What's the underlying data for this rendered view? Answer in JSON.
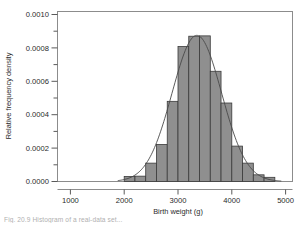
{
  "figure": {
    "caption": "Fig. 20.9 Histogram of a real-data set..."
  },
  "chart_data": {
    "type": "bar",
    "title": "",
    "subtitle": "",
    "xlabel": "Birth weight (g)",
    "ylabel": "Relative frequency density",
    "xlim": [
      700,
      5150
    ],
    "ylim": [
      0.0,
      0.00105
    ],
    "xticks": [
      1000,
      2000,
      3000,
      4000,
      5000
    ],
    "xtick_labels": [
      "1000",
      "2000",
      "3000",
      "4000",
      "5000"
    ],
    "yticks": [
      0.0,
      0.0002,
      0.0004,
      0.0006,
      0.0008,
      0.001
    ],
    "ytick_labels": [
      "0.0000",
      "0.0002",
      "0.0004",
      "0.0006",
      "0.0008",
      "0.0010"
    ],
    "yminorticks": [
      0.0001,
      0.0003,
      0.0005,
      0.0007,
      0.0009
    ],
    "grid": false,
    "legend": null,
    "bin_width": 200,
    "bar_color": "#8f8f8f",
    "bar_edge_color": "#3a3a3a",
    "curve_color": "#4a4a4a",
    "frame_color": "#8c8c8c",
    "bin_edges": [
      2000,
      2200,
      2400,
      2600,
      2800,
      3000,
      3200,
      3400,
      3600,
      3800,
      4000,
      4200,
      4400,
      4600,
      4800
    ],
    "categories": [
      "2000-2200",
      "2200-2400",
      "2400-2600",
      "2600-2800",
      "2800-3000",
      "3000-3200",
      "3200-3400",
      "3400-3600",
      "3600-3800",
      "3800-4000",
      "4000-4200",
      "4200-4400",
      "4400-4600",
      "4600-4800"
    ],
    "values": [
      3e-05,
      3.2e-05,
      0.00011,
      0.000222,
      0.00048,
      0.000808,
      0.00087,
      0.000872,
      0.00066,
      0.00047,
      0.000212,
      0.00011,
      4e-05,
      2.5e-05
    ],
    "series": [
      {
        "name": "Relative frequency density",
        "type": "bar",
        "values": [
          3e-05,
          3.2e-05,
          0.00011,
          0.000222,
          0.00048,
          0.000808,
          0.00087,
          0.000872,
          0.00066,
          0.00047,
          0.000212,
          0.00011,
          4e-05,
          2.5e-05
        ]
      },
      {
        "name": "Fitted normal curve",
        "type": "line",
        "mean": 3350,
        "sd": 460,
        "peak": 0.000875
      }
    ],
    "annotations": []
  }
}
